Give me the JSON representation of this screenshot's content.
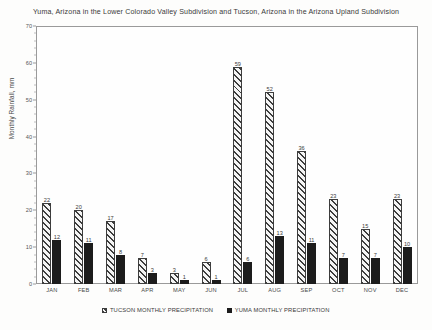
{
  "chart_data": {
    "type": "bar",
    "title": "Yuma, Arizona in the Lower Colorado Valley Subdivision and Tucson, Arizona in the Arizona Upland Subdivision",
    "xlabel": "",
    "ylabel": "Monthly Rainfall, mm",
    "ylim": [
      0,
      70
    ],
    "ytick_step": 10,
    "yticks": [
      0,
      10,
      20,
      30,
      40,
      50,
      60,
      70
    ],
    "grid": false,
    "legend_position": "bottom",
    "categories": [
      "JAN",
      "FEB",
      "MAR",
      "APR",
      "MAY",
      "JUN",
      "JUL",
      "AUG",
      "SEP",
      "OCT",
      "NOV",
      "DEC"
    ],
    "series": [
      {
        "name": "TUCSON MONTHLY PRECIPITATION",
        "style": "hatched",
        "color": "#3d3d3d",
        "values": [
          22,
          20,
          17,
          7,
          3,
          6,
          59,
          52,
          36,
          23,
          15,
          23
        ]
      },
      {
        "name": "YUMA MONTHLY PRECIPITATION",
        "style": "solid",
        "color": "#1c1c1c",
        "values": [
          12,
          11,
          8,
          3,
          1,
          1,
          6,
          13,
          11,
          7,
          7,
          10
        ]
      }
    ]
  }
}
